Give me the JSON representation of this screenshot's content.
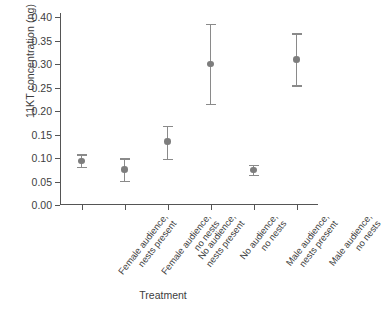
{
  "chart_data": {
    "type": "scatter",
    "title": "",
    "xlabel": "Treatment",
    "ylabel": "11KT concentration (ng)",
    "ylim": [
      0.0,
      0.4
    ],
    "yticks": [
      "0.00",
      "0.05",
      "0.10",
      "0.15",
      "0.20",
      "0.25",
      "0.30",
      "0.35",
      "0.40"
    ],
    "ytick_values": [
      0.0,
      0.05,
      0.1,
      0.15,
      0.2,
      0.25,
      0.3,
      0.35,
      0.4
    ],
    "grid": false,
    "legend": "none",
    "error_bars": "vertical",
    "categories": [
      "Female audience, nests present",
      "Female audience, no nests",
      "No audience, nests present",
      "No audience, no nests",
      "Male audience, nests present",
      "Male audience, no nests"
    ],
    "category_lines": [
      [
        "Female audience,",
        "nests present"
      ],
      [
        "Female audience,",
        "no nests"
      ],
      [
        "No audience,",
        "nests present"
      ],
      [
        "No audience,",
        "no nests"
      ],
      [
        "Male audience,",
        "nests present"
      ],
      [
        "Male audience,",
        "no nests"
      ]
    ],
    "values": [
      0.094,
      0.076,
      0.135,
      0.3,
      0.074,
      0.31
    ],
    "err_low": [
      0.081,
      0.051,
      0.098,
      0.215,
      0.064,
      0.255
    ],
    "err_high": [
      0.108,
      0.099,
      0.168,
      0.385,
      0.086,
      0.365
    ],
    "marker_color": "#7d7d7d",
    "errorbar_color": "#8a8a8a",
    "axis_color": "#555555",
    "text_color": "#3d3d3d",
    "background": "#ffffff"
  }
}
